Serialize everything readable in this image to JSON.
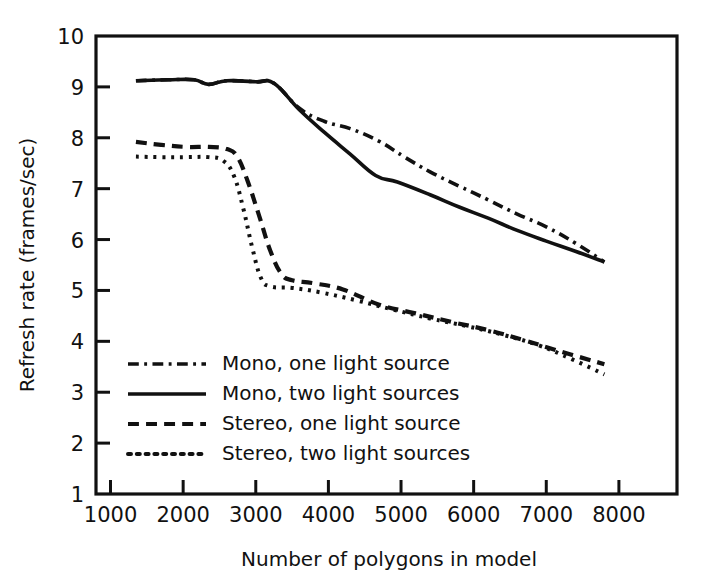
{
  "chart_data": {
    "type": "line",
    "title": "",
    "xlabel": "Number of polygons in model",
    "ylabel": "Refresh rate (frames/sec)",
    "xlim": [
      800,
      8800
    ],
    "ylim": [
      1,
      10
    ],
    "xticks": [
      1000,
      2000,
      3000,
      4000,
      5000,
      6000,
      7000,
      8000
    ],
    "xtick_labels": [
      "1000",
      "2000",
      "3000",
      "4000",
      "5000",
      "6000",
      "7000",
      "8000"
    ],
    "yticks": [
      1,
      2,
      3,
      4,
      5,
      6,
      7,
      8,
      9,
      10
    ],
    "ytick_labels": [
      "1",
      "2",
      "3",
      "4",
      "5",
      "6",
      "7",
      "8",
      "9",
      "10"
    ],
    "grid": false,
    "legend_position": "lower-left-inside",
    "series": [
      {
        "name": "Mono, one light source",
        "dash": "dashdot",
        "color": "#111111",
        "points": [
          [
            1350,
            9.12
          ],
          [
            1800,
            9.14
          ],
          [
            2150,
            9.14
          ],
          [
            2350,
            9.05
          ],
          [
            2600,
            9.12
          ],
          [
            3000,
            9.1
          ],
          [
            3250,
            9.07
          ],
          [
            3600,
            8.58
          ],
          [
            3950,
            8.32
          ],
          [
            4300,
            8.18
          ],
          [
            4700,
            7.93
          ],
          [
            5050,
            7.62
          ],
          [
            5400,
            7.33
          ],
          [
            5800,
            7.05
          ],
          [
            6200,
            6.78
          ],
          [
            6600,
            6.5
          ],
          [
            7000,
            6.25
          ],
          [
            7400,
            5.93
          ],
          [
            7800,
            5.56
          ]
        ]
      },
      {
        "name": "Mono, two light sources",
        "dash": "solid",
        "color": "#111111",
        "points": [
          [
            1350,
            9.12
          ],
          [
            1800,
            9.14
          ],
          [
            2150,
            9.14
          ],
          [
            2350,
            9.05
          ],
          [
            2600,
            9.12
          ],
          [
            3000,
            9.1
          ],
          [
            3250,
            9.07
          ],
          [
            3600,
            8.55
          ],
          [
            3950,
            8.1
          ],
          [
            4300,
            7.68
          ],
          [
            4650,
            7.26
          ],
          [
            4950,
            7.13
          ],
          [
            5400,
            6.88
          ],
          [
            5800,
            6.64
          ],
          [
            6200,
            6.42
          ],
          [
            6600,
            6.18
          ],
          [
            7000,
            5.97
          ],
          [
            7400,
            5.77
          ],
          [
            7800,
            5.56
          ]
        ]
      },
      {
        "name": "Stereo, one light source",
        "dash": "dashed",
        "color": "#111111",
        "points": [
          [
            1350,
            7.92
          ],
          [
            1700,
            7.86
          ],
          [
            2050,
            7.82
          ],
          [
            2350,
            7.82
          ],
          [
            2600,
            7.78
          ],
          [
            2750,
            7.62
          ],
          [
            2900,
            7.1
          ],
          [
            3050,
            6.45
          ],
          [
            3200,
            5.78
          ],
          [
            3350,
            5.33
          ],
          [
            3500,
            5.2
          ],
          [
            3800,
            5.14
          ],
          [
            4200,
            5.02
          ],
          [
            4700,
            4.72
          ],
          [
            5200,
            4.55
          ],
          [
            5700,
            4.38
          ],
          [
            6200,
            4.22
          ],
          [
            6700,
            4.02
          ],
          [
            7200,
            3.8
          ],
          [
            7800,
            3.55
          ]
        ]
      },
      {
        "name": "Stereo, two light sources",
        "dash": "dotted",
        "color": "#111111",
        "points": [
          [
            1350,
            7.63
          ],
          [
            1700,
            7.62
          ],
          [
            2050,
            7.62
          ],
          [
            2350,
            7.62
          ],
          [
            2550,
            7.55
          ],
          [
            2700,
            7.25
          ],
          [
            2830,
            6.6
          ],
          [
            2950,
            5.85
          ],
          [
            3070,
            5.25
          ],
          [
            3200,
            5.08
          ],
          [
            3500,
            5.05
          ],
          [
            3900,
            4.96
          ],
          [
            4400,
            4.8
          ],
          [
            4900,
            4.62
          ],
          [
            5400,
            4.45
          ],
          [
            5900,
            4.3
          ],
          [
            6400,
            4.13
          ],
          [
            6900,
            3.92
          ],
          [
            7350,
            3.65
          ],
          [
            7800,
            3.35
          ]
        ]
      }
    ]
  },
  "legend": {
    "entries": [
      {
        "label": "Mono, one light source",
        "dash": "dashdot"
      },
      {
        "label": "Mono, two light sources",
        "dash": "solid"
      },
      {
        "label": "Stereo, one light source",
        "dash": "dashed"
      },
      {
        "label": "Stereo, two light sources",
        "dash": "dotted"
      }
    ]
  }
}
